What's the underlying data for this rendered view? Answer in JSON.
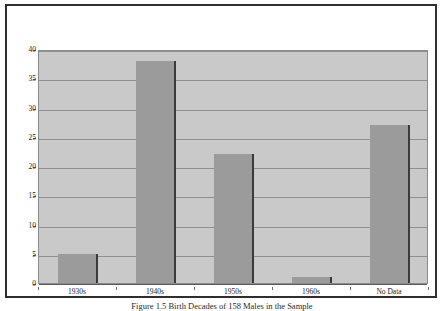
{
  "figure": {
    "caption": "Figure 1.5 Birth Decades of 158 Males in the Sample",
    "frame_color": "#2e2e2e",
    "plot_background": "#c9c9c9",
    "bar_color": "#9b9b9b",
    "bar_edge_color": "#3a3a3a",
    "gridline_color": "#8f8f8f"
  },
  "chart_data": {
    "type": "bar",
    "title": "",
    "subtitle": "",
    "xlabel": "",
    "ylabel": "",
    "categories": [
      "1930s",
      "1940s",
      "1950s",
      "1960s",
      "No Data"
    ],
    "values": [
      5,
      38,
      22,
      1,
      27
    ],
    "ylim": [
      0,
      40
    ],
    "ytick_step": 5,
    "yticks": [
      0,
      5,
      10,
      15,
      20,
      25,
      30,
      35,
      40
    ],
    "ytick_labels": [
      "0",
      "5",
      "10",
      "15",
      "20",
      "25",
      "30",
      "35",
      "40"
    ],
    "grid": true,
    "grid_axis": "y",
    "legend": false,
    "legend_position": "none",
    "annotations": []
  }
}
